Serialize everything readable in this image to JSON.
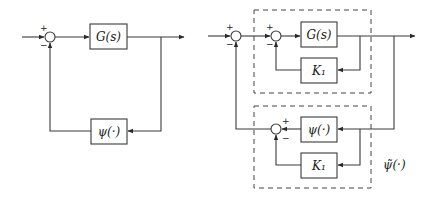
{
  "figure": {
    "left_diagram": {
      "forward_block": "G(s)",
      "feedback_block": "ψ(·)",
      "summing_junction": {
        "top_sign": "+",
        "bottom_sign": "−"
      }
    },
    "right_diagram": {
      "forward_block": "G(s)",
      "inner_feedback_block": "K₁",
      "lower_block": "ψ(·)",
      "lower_gain_block": "K₁",
      "lower_group_label": "ψ̃(·)",
      "outer_sum": {
        "top_sign": "+",
        "bottom_sign": "−"
      },
      "inner_sum": {
        "top_sign": "+",
        "bottom_sign": "−"
      },
      "lower_sum": {
        "top_sign": "+",
        "bottom_sign": "−"
      }
    },
    "colors": {
      "line": "#3a3a3a",
      "background": "#ffffff"
    }
  }
}
